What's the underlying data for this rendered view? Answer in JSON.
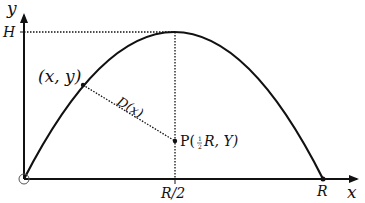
{
  "diagram": {
    "type": "projectile-trajectory",
    "axes": {
      "x_label": "x",
      "y_label": "y",
      "origin_marker": "circle"
    },
    "labels": {
      "height": "H",
      "point_on_curve": "(x, y)",
      "distance": "D(x)",
      "point_p_prefix": "P(",
      "point_p_fraction_num": "1",
      "point_p_fraction_den": "2",
      "point_p_suffix": "R, Y)",
      "half_range": "R/2",
      "range": "R"
    },
    "colors": {
      "stroke": "#111111",
      "background": "#ffffff"
    }
  }
}
